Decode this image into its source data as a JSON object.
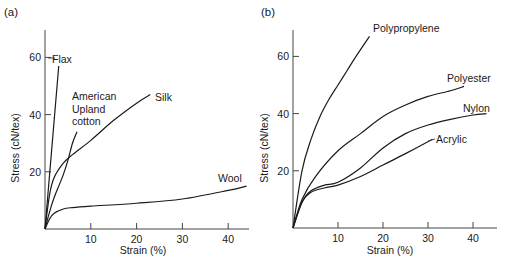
{
  "chart_data": [
    {
      "type": "line",
      "panel_label": "(a)",
      "title": "",
      "xlabel": "Strain (%)",
      "ylabel": "Stress (cN/tex)",
      "xlim": [
        0,
        45
      ],
      "ylim": [
        0,
        70
      ],
      "xticks": [
        10,
        20,
        30,
        40
      ],
      "yticks": [
        20,
        40,
        60
      ],
      "grid": false,
      "legend": "inline labels",
      "series": [
        {
          "name": "Flax",
          "x": [
            0,
            1,
            2,
            3
          ],
          "y": [
            0,
            19,
            38,
            57
          ]
        },
        {
          "name": "American Upland cotton",
          "x": [
            0,
            1,
            2,
            3,
            4,
            5,
            6,
            7
          ],
          "y": [
            0,
            6,
            11,
            15,
            19,
            24,
            30,
            34
          ]
        },
        {
          "name": "Silk",
          "x": [
            0,
            1,
            2,
            4,
            6,
            10,
            15,
            20,
            23
          ],
          "y": [
            0,
            12,
            18,
            23,
            26,
            31,
            38,
            44,
            47
          ]
        },
        {
          "name": "Wool",
          "x": [
            0,
            1,
            2,
            4,
            6,
            10,
            20,
            30,
            40,
            44
          ],
          "y": [
            0,
            3.5,
            5.5,
            7,
            7.5,
            8,
            9,
            10.5,
            13.5,
            15
          ]
        }
      ]
    },
    {
      "type": "line",
      "panel_label": "(b)",
      "title": "",
      "xlabel": "Strain (%)",
      "ylabel": "Stress (cN/tex)",
      "xlim": [
        0,
        45
      ],
      "ylim": [
        0,
        70
      ],
      "xticks": [
        10,
        20,
        30,
        40
      ],
      "yticks": [
        20,
        40,
        60
      ],
      "grid": false,
      "legend": "inline labels",
      "series": [
        {
          "name": "Polypropylene",
          "x": [
            0,
            2,
            4,
            6,
            8,
            10,
            12,
            14,
            17
          ],
          "y": [
            0,
            20,
            31,
            39,
            45,
            50,
            55,
            60,
            67
          ]
        },
        {
          "name": "Polyester",
          "x": [
            0,
            2,
            5,
            10,
            15,
            20,
            25,
            30,
            35,
            38
          ],
          "y": [
            0,
            10,
            18,
            27,
            33,
            39,
            43,
            46,
            48,
            49.5
          ]
        },
        {
          "name": "Nylon",
          "x": [
            0,
            2,
            4,
            7,
            10,
            15,
            20,
            25,
            30,
            35,
            40,
            43
          ],
          "y": [
            0,
            9,
            13,
            15,
            16,
            21,
            28,
            33,
            36,
            38,
            39.5,
            40
          ]
        },
        {
          "name": "Acrylic",
          "x": [
            0,
            2,
            4,
            7,
            10,
            15,
            20,
            25,
            31
          ],
          "y": [
            0,
            9,
            12.5,
            14,
            15,
            18,
            22,
            26,
            31
          ]
        }
      ]
    }
  ]
}
